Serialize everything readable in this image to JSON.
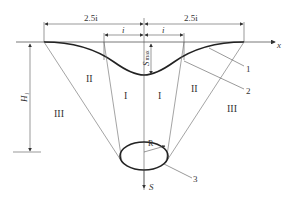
{
  "diagram": {
    "type": "settlement trough cross-section",
    "dimensions": {
      "left_span": "2.5i",
      "right_span": "2.5i",
      "left_inner": "i",
      "right_inner": "i",
      "max_settlement": "S",
      "max_subscript": "max",
      "depth": "H",
      "depth_subscript": "i",
      "radius": "R",
      "settlement_axis": "S",
      "x_axis": "x"
    },
    "zones": {
      "zone_I_left": "I",
      "zone_I_right": "I",
      "zone_II_left": "II",
      "zone_II_right": "II",
      "zone_III_left": "III",
      "zone_III_right": "III"
    },
    "callouts": [
      "1",
      "2",
      "3"
    ]
  }
}
